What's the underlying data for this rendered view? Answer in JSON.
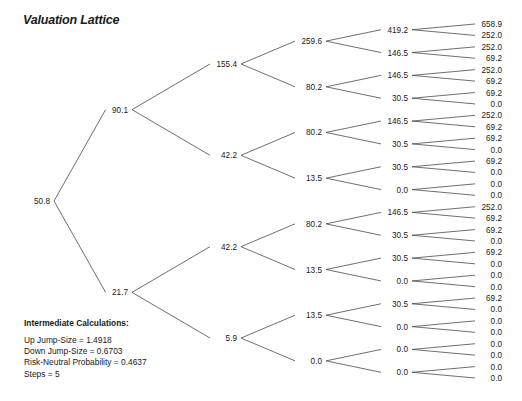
{
  "title": "Valuation Lattice",
  "colors": {
    "text": "#1a1a1a",
    "line": "#4a4a4a",
    "background": "#ffffff"
  },
  "intermediate_calculations": {
    "heading": "Intermediate Calculations:",
    "lines": [
      "Up Jump-Size = 1.4918",
      "Down Jump-Size = 0.6703",
      "Risk-Neutral Probability = 0.4637",
      "Steps = 5"
    ]
  },
  "chart_data": {
    "type": "diagram",
    "subtype": "binomial-lattice-tree",
    "title": "Valuation Lattice",
    "orientation": "left-to-right",
    "steps": 5,
    "up_jump_size": 1.4918,
    "down_jump_size": 0.6703,
    "risk_neutral_probability": 0.4637,
    "levels": [
      {
        "step": 0,
        "x": 50,
        "values": [
          "50.8"
        ]
      },
      {
        "step": 1,
        "x": 128,
        "values": [
          "90.1",
          "21.7"
        ]
      },
      {
        "step": 2,
        "x": 237,
        "values": [
          "155.4",
          "42.2",
          "42.2",
          "5.9"
        ]
      },
      {
        "step": 3,
        "x": 322,
        "values": [
          "259.6",
          "80.2",
          "80.2",
          "13.5",
          "80.2",
          "13.5",
          "13.5",
          "0.0"
        ]
      },
      {
        "step": 4,
        "x": 408,
        "values": [
          "419.2",
          "146.5",
          "146.5",
          "30.5",
          "146.5",
          "30.5",
          "30.5",
          "0.0",
          "146.5",
          "30.5",
          "30.5",
          "0.0",
          "30.5",
          "0.0",
          "0.0",
          "0.0"
        ]
      },
      {
        "step": 5,
        "x": 502,
        "values": [
          "658.9",
          "252.0",
          "252.0",
          "69.2",
          "252.0",
          "69.2",
          "69.2",
          "0.0",
          "252.0",
          "69.2",
          "69.2",
          "0.0",
          "69.2",
          "0.0",
          "0.0",
          "0.0",
          "252.0",
          "69.2",
          "69.2",
          "0.0",
          "69.2",
          "0.0",
          "0.0",
          "0.0",
          "69.2",
          "0.0",
          "0.0",
          "0.0",
          "0.0",
          "0.0",
          "0.0",
          "0.0"
        ]
      }
    ]
  }
}
